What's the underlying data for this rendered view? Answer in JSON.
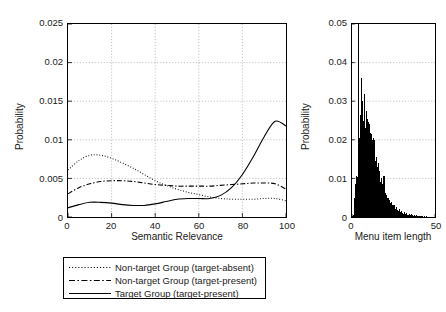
{
  "figure": {
    "title": "",
    "background": "#ffffff",
    "foreground": "#1a1a1a"
  },
  "panels": {
    "left": {
      "xlabel": "Semantic Relevance",
      "ylabel": "Probability",
      "xticks": [
        "0",
        "20",
        "40",
        "60",
        "80",
        "100"
      ],
      "yticks": [
        "0",
        "0.005",
        "0.01",
        "0.015",
        "0.02",
        "0.025"
      ]
    },
    "right": {
      "xlabel": "Menu item length",
      "ylabel": "Probability",
      "xticks": [
        "0",
        "50"
      ],
      "yticks": [
        "0",
        "0.01",
        "0.02",
        "0.03",
        "0.04",
        "0.05"
      ]
    }
  },
  "legend": {
    "items": [
      {
        "label": "Non-target Group (target-absent)",
        "style": "dotted"
      },
      {
        "label": "Non-target Group (target-present)",
        "style": "dashdot"
      },
      {
        "label": "Target Group (target-present)",
        "style": "solid"
      }
    ]
  },
  "chart_data": [
    {
      "id": "semantic-relevance",
      "type": "line",
      "title": "",
      "xlabel": "Semantic Relevance",
      "ylabel": "Probability",
      "xlim": [
        0,
        100
      ],
      "ylim": [
        0,
        0.025
      ],
      "xticks": [
        0,
        20,
        40,
        60,
        80,
        100
      ],
      "yticks": [
        0,
        0.005,
        0.01,
        0.015,
        0.02,
        0.025
      ],
      "grid": true,
      "legend_position": "below-figure",
      "x": [
        0,
        5,
        10,
        15,
        20,
        25,
        30,
        35,
        40,
        45,
        50,
        55,
        60,
        65,
        70,
        75,
        80,
        85,
        90,
        95,
        100
      ],
      "series": [
        {
          "name": "Non-target Group (target-absent)",
          "style": "dotted",
          "color": "#000000",
          "values": [
            0.0061,
            0.0073,
            0.008,
            0.008,
            0.0076,
            0.007,
            0.0063,
            0.0055,
            0.0047,
            0.0041,
            0.0036,
            0.0032,
            0.0029,
            0.0026,
            0.0024,
            0.0023,
            0.0023,
            0.0023,
            0.0024,
            0.0024,
            0.0021
          ]
        },
        {
          "name": "Non-target Group (target-present)",
          "style": "dashdot",
          "color": "#000000",
          "values": [
            0.003,
            0.0038,
            0.0043,
            0.0046,
            0.0047,
            0.0047,
            0.0046,
            0.0044,
            0.0042,
            0.0041,
            0.004,
            0.004,
            0.004,
            0.004,
            0.0041,
            0.0042,
            0.0043,
            0.0044,
            0.0044,
            0.0043,
            0.0036
          ]
        },
        {
          "name": "Target Group (target-present)",
          "style": "solid",
          "color": "#000000",
          "values": [
            0.0012,
            0.0016,
            0.0019,
            0.0019,
            0.0018,
            0.0016,
            0.0015,
            0.0015,
            0.0017,
            0.002,
            0.0023,
            0.0024,
            0.0024,
            0.0024,
            0.0028,
            0.0038,
            0.0055,
            0.0078,
            0.0104,
            0.0124,
            0.0118
          ]
        }
      ]
    },
    {
      "id": "menu-item-length",
      "type": "bar",
      "title": "",
      "xlabel": "Menu item length",
      "ylabel": "Probability",
      "xlim": [
        0,
        50
      ],
      "ylim": [
        0,
        0.05
      ],
      "xticks": [
        0,
        50
      ],
      "yticks": [
        0,
        0.01,
        0.02,
        0.03,
        0.04,
        0.05
      ],
      "grid": true,
      "bin_width": 0.5,
      "bin_centers": [
        0.25,
        0.75,
        1.25,
        1.75,
        2.25,
        2.75,
        3.25,
        3.75,
        4.25,
        4.75,
        5.25,
        5.75,
        6.25,
        6.75,
        7.25,
        7.75,
        8.25,
        8.75,
        9.25,
        9.75,
        10.25,
        10.75,
        11.25,
        11.75,
        12.25,
        12.75,
        13.25,
        13.75,
        14.25,
        14.75,
        15.25,
        15.75,
        16.25,
        16.75,
        17.25,
        17.75,
        18.25,
        18.75,
        19.25,
        19.75,
        20.25,
        20.75,
        21.25,
        21.75,
        22.25,
        22.75,
        23.25,
        23.75,
        24.25,
        24.75,
        25.25,
        25.75,
        26.25,
        26.75,
        27.25,
        27.75,
        28.25,
        28.75,
        29.25,
        29.75,
        30.25,
        30.75,
        31.25,
        31.75,
        32.25,
        32.75,
        33.25,
        33.75,
        34.25,
        34.75,
        35.25,
        35.75,
        36.25,
        36.75,
        37.25,
        37.75,
        38.25,
        38.75,
        39.25,
        39.75,
        40.25,
        40.75,
        41.25,
        41.75,
        42.25,
        42.75,
        43.25,
        43.75,
        44.25,
        44.75,
        45.25,
        45.75,
        46.25,
        46.75,
        47.25,
        47.75,
        48.25,
        48.75,
        49.25,
        49.75
      ],
      "values": [
        0.0002,
        0.0006,
        0.003,
        0.005,
        0.0085,
        0.0105,
        0.0104,
        0.05,
        0.0165,
        0.0205,
        0.0265,
        0.036,
        0.03,
        0.025,
        0.0315,
        0.0318,
        0.023,
        0.0275,
        0.0255,
        0.0245,
        0.0225,
        0.024,
        0.0218,
        0.0215,
        0.02,
        0.0205,
        0.016,
        0.02,
        0.0145,
        0.0155,
        0.013,
        0.014,
        0.0105,
        0.012,
        0.009,
        0.01,
        0.0085,
        0.0105,
        0.0068,
        0.0105,
        0.0062,
        0.0058,
        0.005,
        0.0048,
        0.0042,
        0.0044,
        0.0035,
        0.0038,
        0.003,
        0.0032,
        0.0026,
        0.003,
        0.0022,
        0.0026,
        0.0019,
        0.0022,
        0.0016,
        0.002,
        0.0013,
        0.0016,
        0.0011,
        0.0014,
        0.0009,
        0.0012,
        0.0008,
        0.001,
        0.0006,
        0.0009,
        0.0005,
        0.0008,
        0.0004,
        0.0007,
        0.0004,
        0.0006,
        0.0003,
        0.0005,
        0.0003,
        0.0004,
        0.0002,
        0.0004,
        0.0002,
        0.0003,
        0.0002,
        0.0003,
        0.0002,
        0.0002,
        0.0001,
        0.0002,
        0.0001,
        0.0002,
        0.0001,
        0.0001,
        0.0001,
        0.0001,
        0.0001,
        0.0001,
        0.0,
        0.0001,
        0.0,
        0.0001
      ]
    }
  ]
}
